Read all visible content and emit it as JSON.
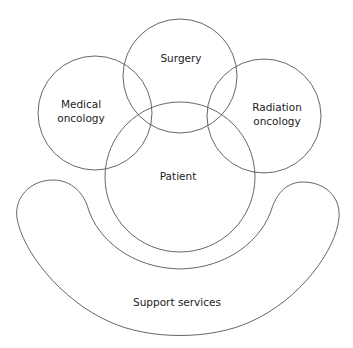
{
  "diagram": {
    "nodes": [
      {
        "id": "surgery",
        "lines": [
          "Surgery"
        ]
      },
      {
        "id": "medical_oncology",
        "lines": [
          "Medical",
          "oncology"
        ]
      },
      {
        "id": "radiation_oncology",
        "lines": [
          "Radiation",
          "oncology"
        ]
      },
      {
        "id": "patient",
        "lines": [
          "Patient"
        ]
      },
      {
        "id": "support_services",
        "lines": [
          "Support services"
        ]
      }
    ],
    "relationships": [
      "Surgery, Medical oncology, and Radiation oncology overlap with Patient",
      "Surgery overlaps Medical oncology and Radiation oncology",
      "Support services cradles Patient from below"
    ],
    "colors": {
      "stroke": "#555555",
      "text": "#222222",
      "background": "#ffffff"
    }
  }
}
